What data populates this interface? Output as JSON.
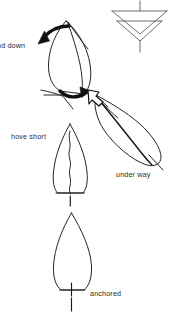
{
  "figure": {
    "type": "nautical-instructional-diagram",
    "background_color": "#ffffff",
    "ink_color": "#1a1a1a",
    "label_color": "#2b2b2b"
  },
  "labels": {
    "and_down": "nd down",
    "hove_short": "hove short",
    "under_way": "under way",
    "anchored": "anchored"
  },
  "wind_indicator": {
    "name": "wind-direction-arrow",
    "description": "vertical shaft with two stacked open chevron arrowheads pointing down",
    "direction": "down",
    "chevron_count": 2,
    "stroke_color": "#5a5a5a"
  },
  "boats": [
    {
      "id": "boat-anchored",
      "label": "anchored",
      "state": "anchored",
      "heading": "bow-up",
      "rode": "straight vertical line below stern",
      "hull_style": "outline"
    },
    {
      "id": "boat-hove-short",
      "label": "hove short",
      "state": "hove short",
      "heading": "bow-up",
      "rode": "wavy line running up the centreline of the hull",
      "hull_style": "outline"
    },
    {
      "id": "boat-and-down",
      "label": "nd down",
      "state": "anchor aweigh and down",
      "heading": "tilted, swinging",
      "rode": "short rode with curved swing arrows at bow and stern",
      "hull_style": "outline with heavy swing arrows"
    },
    {
      "id": "boat-under-way",
      "label": "under way",
      "state": "under way",
      "heading": "diagonal, bow to upper-left",
      "rode": "none",
      "hull_style": "outline with hollow heading arrow at bow"
    }
  ],
  "arrows": [
    {
      "id": "swing-arrow-bow",
      "style": "solid-black-curved",
      "points_to": "down-left at bow of swinging boat"
    },
    {
      "id": "swing-arrow-stern",
      "style": "solid-black-curved",
      "points_to": "right at stern of swinging boat"
    },
    {
      "id": "heading-arrow",
      "style": "hollow-outline",
      "points_to": "up-left, direction of travel once under way"
    }
  ]
}
